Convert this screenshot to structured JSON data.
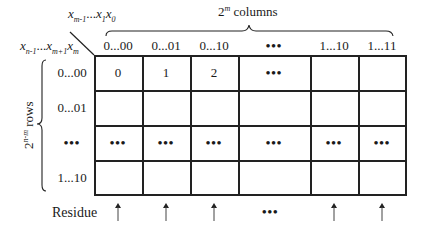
{
  "diagram": {
    "col_var_label": {
      "base": "x",
      "parts": [
        [
          "m-1"
        ],
        "...",
        [
          "1"
        ],
        [
          "0"
        ]
      ]
    },
    "row_var_label": {
      "parts": [
        [
          "n-1"
        ],
        "...",
        [
          "m+1"
        ],
        [
          "m"
        ]
      ]
    },
    "columns_label": {
      "base": "2",
      "exp": "m",
      "text": " columns"
    },
    "rows_label": {
      "base": "2",
      "exp": "n-m",
      "text": " rows"
    },
    "column_headers": [
      "0...00",
      "0...01",
      "0...10",
      "•••",
      "1...10",
      "1...11"
    ],
    "row_headers": [
      "0...00",
      "0...01",
      "•••",
      "1...10"
    ],
    "cells": [
      [
        "0",
        "1",
        "2",
        "•••",
        "",
        ""
      ],
      [
        "",
        "",
        "",
        "",
        "",
        ""
      ],
      [
        "•••",
        "•••",
        "•••",
        "•••",
        "•••",
        "•••"
      ],
      [
        "",
        "",
        "",
        "",
        "",
        ""
      ]
    ],
    "residue_label": "Residue",
    "residue_markers": [
      "arrow-up",
      "arrow-up",
      "arrow-up",
      "•••",
      "arrow-up",
      "arrow-up"
    ],
    "line_color": "#222222"
  }
}
